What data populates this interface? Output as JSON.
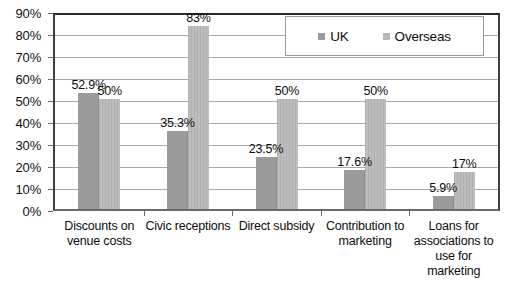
{
  "chart_data": {
    "type": "bar",
    "title": "",
    "subtitle": "",
    "xlabel": "",
    "ylabel": "",
    "ylim": [
      0,
      90
    ],
    "y_tick_labels": [
      "0%",
      "10%",
      "20%",
      "30%",
      "40%",
      "50%",
      "60%",
      "70%",
      "80%",
      "90%"
    ],
    "y_tick_values": [
      0,
      10,
      20,
      30,
      40,
      50,
      60,
      70,
      80,
      90
    ],
    "grid": "horizontal",
    "legend_position": "top-right",
    "categories": [
      "Discounts on venue costs",
      "Civic receptions",
      "Direct subsidy",
      "Contribution to marketing",
      "Loans for associations to use for marketing"
    ],
    "category_lines": [
      [
        "Discounts on",
        "venue costs"
      ],
      [
        "Civic receptions"
      ],
      [
        "Direct subsidy"
      ],
      [
        "Contribution to",
        "marketing"
      ],
      [
        "Loans for",
        "associations to",
        "use for",
        "marketing"
      ]
    ],
    "series": [
      {
        "name": "UK",
        "color": "#9b9b9b",
        "values": [
          52.9,
          35.3,
          23.5,
          17.6,
          5.9
        ],
        "labels": [
          "52.9%",
          "35.3%",
          "23.5%",
          "17.6%",
          "5.9%"
        ]
      },
      {
        "name": "Overseas",
        "color": "#b7b7b7",
        "values": [
          50,
          83,
          50,
          50,
          17
        ],
        "labels": [
          "50%",
          "83%",
          "50%",
          "50%",
          "17%"
        ]
      }
    ]
  },
  "legend": {
    "entries": [
      {
        "label": "UK",
        "swatch": "uk-swatch-icon"
      },
      {
        "label": "Overseas",
        "swatch": "overseas-swatch-icon"
      }
    ]
  }
}
